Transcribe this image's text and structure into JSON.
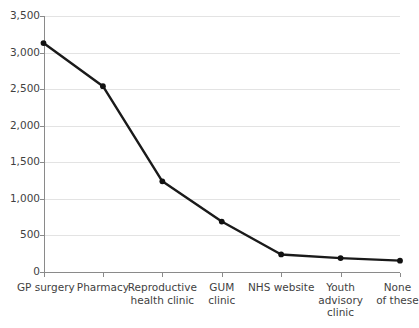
{
  "chart_data": {
    "type": "line",
    "title": "",
    "subtitle": "",
    "xlabel": "",
    "ylabel": "",
    "categories": [
      "GP surgery",
      "Reproductive\nhealth clinic",
      "Pharmacy",
      "GUM\nclinic",
      "NHS website",
      "Youth\nadvisory\nclinic",
      "None\nof these"
    ],
    "category_labels": [
      "GP surgery",
      "Pharmacy",
      "Reproductive health clinic",
      "GUM clinic",
      "NHS website",
      "Youth advisory clinic",
      "None of these"
    ],
    "values": [
      3130,
      2540,
      1240,
      690,
      240,
      190,
      155
    ],
    "series": [
      {
        "name": "",
        "values": [
          3130,
          2540,
          1240,
          690,
          240,
          190,
          155
        ]
      }
    ],
    "ylim": [
      0,
      3500
    ],
    "ytick_values": [
      0,
      500,
      1000,
      1500,
      2000,
      2500,
      3000,
      3500
    ],
    "ytick_labels": [
      "0",
      "500",
      "1,000",
      "1,500",
      "2,000",
      "2,500",
      "3,000",
      "3,500"
    ],
    "grid": true,
    "grid_axis": "y",
    "legend": false,
    "legend_position": "none",
    "marker": "circle",
    "line_color": "#111111",
    "grid_color": "#e3e3e3",
    "axis_color": "#8a8a8a",
    "text_color": "#3f3f3f"
  },
  "xaxis_label_lines": [
    [
      "GP surgery"
    ],
    [
      "Pharmacy"
    ],
    [
      "Reproductive",
      "health clinic"
    ],
    [
      "GUM",
      "clinic"
    ],
    [
      "NHS website"
    ],
    [
      "Youth",
      "advisory",
      "clinic"
    ],
    [
      "None",
      "of these"
    ]
  ]
}
